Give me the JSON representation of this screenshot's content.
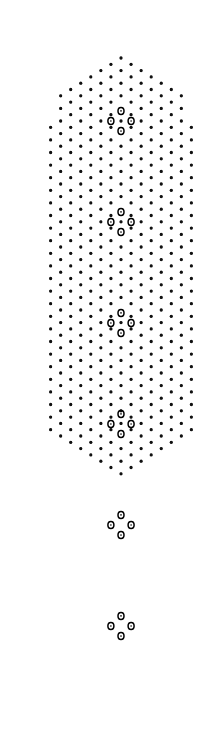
{
  "figure": {
    "title": "Electron diffraction dot pattern",
    "width": 162,
    "height": 750,
    "background_color": "#ffffff",
    "dot_color": "#111111"
  },
  "chart_data": {
    "type": "scatter",
    "title": "Electron diffraction dot pattern",
    "subtitle": "",
    "xlabel": "",
    "ylabel": "",
    "xlim": [
      0,
      162
    ],
    "ylim": [
      0,
      750
    ],
    "grid": false,
    "legend_position": "none",
    "annotations": [],
    "tick_labels": {
      "x": [],
      "y": []
    },
    "lattice": {
      "description": "oblique/rhombic reciprocal lattice of reflections",
      "origin_x": 81,
      "origin_y": 105,
      "vector_a": {
        "dx": 10.05,
        "dy": 6.3
      },
      "vector_b": {
        "dx": -10.05,
        "dy": 6.3
      },
      "index_range_i": [
        -28,
        28
      ],
      "index_range_j": [
        -28,
        28
      ],
      "small_dot_radius_px": 1.55,
      "small_dot_color": "#111111"
    },
    "superlattice": {
      "description": "clusters of four intense ring-shaped reflections repeating along the column axis",
      "cluster_period_y": 100.8,
      "cluster_center_x": 81,
      "cluster_centers_y": [
        105,
        206,
        307,
        408,
        509,
        610,
        711
      ],
      "cluster_offsets": [
        {
          "dx": 0,
          "dy": -10.1,
          "label": "top"
        },
        {
          "dx": -10.1,
          "dy": 0,
          "label": "left"
        },
        {
          "dx": 10.1,
          "dy": 0,
          "label": "right"
        },
        {
          "dx": 0,
          "dy": 10.1,
          "label": "bottom"
        }
      ],
      "ring_outer_radius_px": 3.5,
      "ring_inner_radius_px": 1.5,
      "ring_stroke_width_px": 1.5,
      "ring_color": "#000000"
    },
    "envelope": {
      "description": "beam-stop silhouette clipping the lattice: domed top, straight sides, notched bottom",
      "left_edge_x": 2,
      "right_edge_x": 160,
      "dome_apex_y": 40,
      "dome_shoulder_y": 150,
      "straight_section": [
        150,
        640
      ],
      "notch_apex_y": 745,
      "notch_shoulder_y": 640,
      "notch_center_x": 81
    },
    "series": [
      {
        "name": "lattice reflections",
        "marker": "filled-square-dot",
        "count_approx": 640
      },
      {
        "name": "intense reflections",
        "marker": "open-ring",
        "count_approx": 28
      }
    ]
  }
}
